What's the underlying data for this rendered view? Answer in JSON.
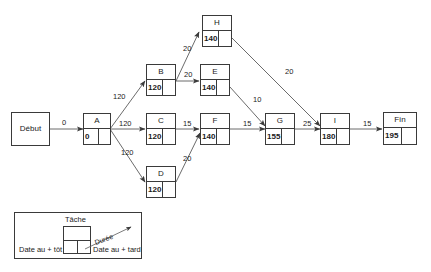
{
  "diagram": {
    "type": "pert-network",
    "nodes": [
      {
        "id": "debut",
        "label": "Début",
        "kind": "terminal",
        "early": "",
        "late": ""
      },
      {
        "id": "A",
        "label": "A",
        "kind": "task",
        "early": "0",
        "late": ""
      },
      {
        "id": "B",
        "label": "B",
        "kind": "task",
        "early": "120",
        "late": ""
      },
      {
        "id": "C",
        "label": "C",
        "kind": "task",
        "early": "120",
        "late": ""
      },
      {
        "id": "D",
        "label": "D",
        "kind": "task",
        "early": "120",
        "late": ""
      },
      {
        "id": "E",
        "label": "E",
        "kind": "task",
        "early": "140",
        "late": ""
      },
      {
        "id": "F",
        "label": "F",
        "kind": "task",
        "early": "140",
        "late": ""
      },
      {
        "id": "H",
        "label": "H",
        "kind": "task",
        "early": "140",
        "late": ""
      },
      {
        "id": "G",
        "label": "G",
        "kind": "task",
        "early": "155",
        "late": ""
      },
      {
        "id": "I",
        "label": "I",
        "kind": "task",
        "early": "180",
        "late": ""
      },
      {
        "id": "fin",
        "label": "Fin",
        "kind": "task",
        "early": "195",
        "late": ""
      }
    ],
    "edges": [
      {
        "from": "debut",
        "to": "A",
        "label": "0"
      },
      {
        "from": "A",
        "to": "B",
        "label": "120"
      },
      {
        "from": "A",
        "to": "C",
        "label": "120"
      },
      {
        "from": "A",
        "to": "D",
        "label": "120"
      },
      {
        "from": "B",
        "to": "H",
        "label": "20"
      },
      {
        "from": "B",
        "to": "E",
        "label": "20"
      },
      {
        "from": "C",
        "to": "F",
        "label": "15"
      },
      {
        "from": "D",
        "to": "F",
        "label": "20"
      },
      {
        "from": "E",
        "to": "G",
        "label": "10"
      },
      {
        "from": "F",
        "to": "G",
        "label": "15"
      },
      {
        "from": "H",
        "to": "I",
        "label": "20"
      },
      {
        "from": "G",
        "to": "I",
        "label": "25"
      },
      {
        "from": "I",
        "to": "fin",
        "label": "15"
      }
    ]
  },
  "legend": {
    "task_label": "Tâche",
    "duration_label": "Durée",
    "early_label": "Date au + tôt",
    "late_label": "Date au + tard"
  },
  "colors": {
    "stroke": "#3a3a3a",
    "text": "#1a1a1a",
    "background": "#ffffff"
  }
}
